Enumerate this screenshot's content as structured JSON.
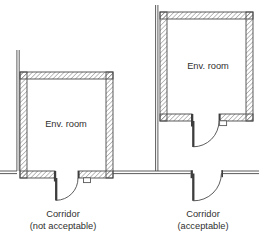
{
  "figure": {
    "type": "floor-plan-diagram",
    "background": "#ffffff",
    "line_color": "#4a4a4a",
    "hatch_color": "#707070",
    "text_color": "#2f2f2f"
  },
  "left_example": {
    "room_label": "Env. room",
    "corridor_label": "Corridor",
    "corridor_note": "(not acceptable)"
  },
  "right_example": {
    "room_label": "Env. room",
    "corridor_label": "Corridor",
    "corridor_note": "(acceptable)"
  }
}
